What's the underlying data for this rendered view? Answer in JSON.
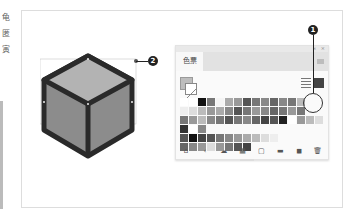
{
  "side_text": [
    "龟",
    "匿",
    "寅"
  ],
  "callouts": {
    "one": "1",
    "two": "2"
  },
  "panel": {
    "tab_label": "色票",
    "top_controls": {
      "collapse": "«",
      "close": "×"
    },
    "view_buttons": [
      "list-view",
      "grid-view"
    ],
    "swatch_rows": [
      [
        "#ffffff",
        "#ffffff",
        "#111111",
        "#777777",
        "#f4f4f4",
        "#aaaaaa",
        "#999999",
        "#555555",
        "#777777",
        "#888888",
        "#666666",
        "#888888",
        "#777777",
        "#bbbbbb"
      ],
      [
        "#eeeeee",
        "#dddddd",
        "#bbbbbb",
        "#999999",
        "#aaaaaa",
        "#888888",
        "#555555",
        "#777777",
        "#999999",
        "#888888",
        "#666666",
        "#777777",
        "#999999",
        "#777777"
      ],
      [
        "#777777",
        "#999999",
        "#bbbbbb",
        "#888888",
        "#777777",
        "#555555",
        "#777777",
        "#888888",
        "#666666",
        "#444444",
        "#555555",
        "#222222",
        "#ffffff",
        "#999999",
        "#bbbbbb",
        "#dddddd"
      ],
      [
        "#333333",
        "#ffffff",
        "#888888"
      ],
      [
        "#555555",
        "#111111",
        "#444444",
        "#555555",
        "#777777",
        "#888888",
        "#999999",
        "#aaaaaa",
        "#bbbbbb",
        "#dddddd",
        "#eeeeee"
      ],
      [
        "#666666",
        "#888888",
        "#999999",
        "#dddddd",
        "#999999",
        "#777777",
        "#555555",
        "#444444"
      ]
    ],
    "bottom_icons": [
      "library-icon",
      "tag-icon",
      "cloud-icon",
      "swatch-options-icon",
      "new-color-group-icon",
      "folder-icon",
      "new-swatch-icon",
      "delete-icon"
    ],
    "bottom_glyphs": [
      "⌂",
      "‹",
      "☁",
      "▦",
      "▢",
      "▬",
      "◼",
      "🗑"
    ],
    "highlighted_swatch": "#bbbbbb"
  },
  "cube": {
    "top_color": "#b3b3b3",
    "side_color": "#8c8c8c",
    "stroke_color": "#2a2a2a"
  }
}
